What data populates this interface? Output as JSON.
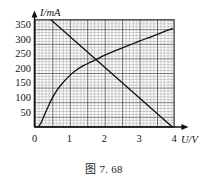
{
  "figure": {
    "caption": "图 7. 68",
    "background_color": "#ffffff",
    "ink_color": "#111111"
  },
  "axes": {
    "y_axis_label": "I/mA",
    "x_axis_label": "U/V",
    "origin_label": "0",
    "y_ticks": [
      "50",
      "100",
      "150",
      "200",
      "250",
      "300",
      "350"
    ],
    "x_ticks": [
      "1",
      "2",
      "3",
      "4"
    ]
  },
  "chart_data": {
    "type": "line",
    "title": "图 7. 68",
    "xlabel": "U/V",
    "ylabel": "I/mA",
    "xlim": [
      0,
      4
    ],
    "ylim": [
      0,
      375
    ],
    "grid": true,
    "grid_minor_step_x": 0.1,
    "grid_minor_step_y": 10,
    "grid_major_step_x": 0.5,
    "grid_major_step_y": 50,
    "legend": "none",
    "series": [
      {
        "name": "rising-curve",
        "style": "curve",
        "description": "Concave non-linear I-U characteristic rising from near origin and flattening toward upper right",
        "x": [
          0.12,
          0.2,
          0.3,
          0.4,
          0.5,
          0.65,
          0.8,
          1.0,
          1.2,
          1.4,
          1.6,
          1.8,
          2.0,
          2.25,
          2.5,
          2.75,
          3.0,
          3.25,
          3.5,
          3.75,
          3.95
        ],
        "y": [
          0,
          18,
          45,
          72,
          97,
          127,
          150,
          175,
          195,
          210,
          222,
          233,
          245,
          258,
          270,
          282,
          294,
          305,
          316,
          328,
          337
        ]
      },
      {
        "name": "load-line",
        "style": "straight",
        "description": "Descending straight load line from above the top of the grid down to the U axis at about 3.95 V",
        "x": [
          0.35,
          3.95
        ],
        "y": [
          380,
          0
        ]
      }
    ],
    "intersection": {
      "x": 1.75,
      "y": 226
    }
  }
}
